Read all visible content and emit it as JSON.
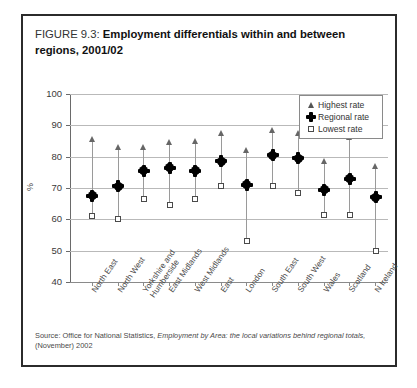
{
  "figure": {
    "number": "FIGURE 9.3:",
    "title": "Employment differentials within and between regions, 2001/02",
    "source": "Source: Office for National Statistics, ",
    "source_italic": "Employment by Area: the local variations behind regional totals,",
    "source_tail": " (November) 2002"
  },
  "legend": {
    "highest": "Highest rate",
    "regional": "Regional rate",
    "lowest": "Lowest rate"
  },
  "chart_data": {
    "type": "scatter",
    "title": "Employment differentials within and between regions, 2001/02",
    "xlabel": "",
    "ylabel": "%",
    "ylim": [
      40,
      100
    ],
    "yticks": [
      40,
      50,
      60,
      70,
      80,
      90,
      100
    ],
    "grid": true,
    "legend_position": "top-right",
    "categories": [
      "North East",
      "North West",
      "Yorkshire and Humberside",
      "East Midlands",
      "West Midlands",
      "East",
      "London",
      "South East",
      "South West",
      "Wales",
      "Scotland",
      "N Ireland"
    ],
    "series": [
      {
        "name": "Highest rate",
        "values": [
          85.0,
          82.5,
          82.5,
          84.0,
          84.5,
          87.0,
          81.5,
          88.0,
          87.0,
          78.0,
          85.5,
          76.5
        ]
      },
      {
        "name": "Regional rate",
        "values": [
          67.5,
          70.5,
          75.5,
          76.5,
          75.5,
          78.5,
          71.0,
          80.5,
          79.5,
          69.5,
          73.0,
          67.0
        ]
      },
      {
        "name": "Lowest rate",
        "values": [
          61.0,
          60.0,
          66.5,
          64.5,
          66.5,
          70.5,
          53.0,
          70.5,
          68.5,
          61.5,
          61.5,
          50.0
        ]
      }
    ]
  },
  "colors": {
    "frame": "#2b2b2b",
    "grid": "#b9b9b9",
    "marker_dark": "#000000",
    "marker_outline": "#4a4a4a"
  }
}
